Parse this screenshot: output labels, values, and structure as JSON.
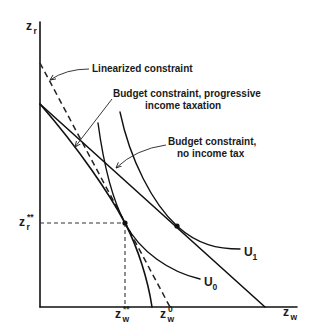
{
  "figure": {
    "background": "#ffffff",
    "ink": "#111111"
  },
  "axes": {
    "y_label": {
      "base": "z",
      "sub": "r"
    },
    "x_label": {
      "base": "z",
      "sub": "w"
    }
  },
  "markers": {
    "zr_star": {
      "base": "z",
      "sub": "r",
      "sup": "**"
    },
    "zw_star": {
      "base": "z",
      "sub": "w",
      "sup": "**"
    },
    "zw_zero": {
      "base": "z",
      "sub": "w",
      "sup": "0"
    }
  },
  "annotations": {
    "linearized": "Linearized constraint",
    "progressive_line1": "Budget constraint, progressive",
    "progressive_line2": "income taxation",
    "no_tax_line1": "Budget constraint,",
    "no_tax_line2": "no income tax"
  },
  "indifference_curves": {
    "u1": {
      "base": "U",
      "sub": "1"
    },
    "u0": {
      "base": "U",
      "sub": "0"
    }
  },
  "elements": [
    "Linearized constraint (dashed line)",
    "Budget constraint, progressive income taxation (concave curve)",
    "Budget constraint, no income tax (straight line)",
    "Indifference curve U0 tangent to progressive constraint at (zw**, zr**)",
    "Indifference curve U1 tangent to no-tax constraint"
  ]
}
